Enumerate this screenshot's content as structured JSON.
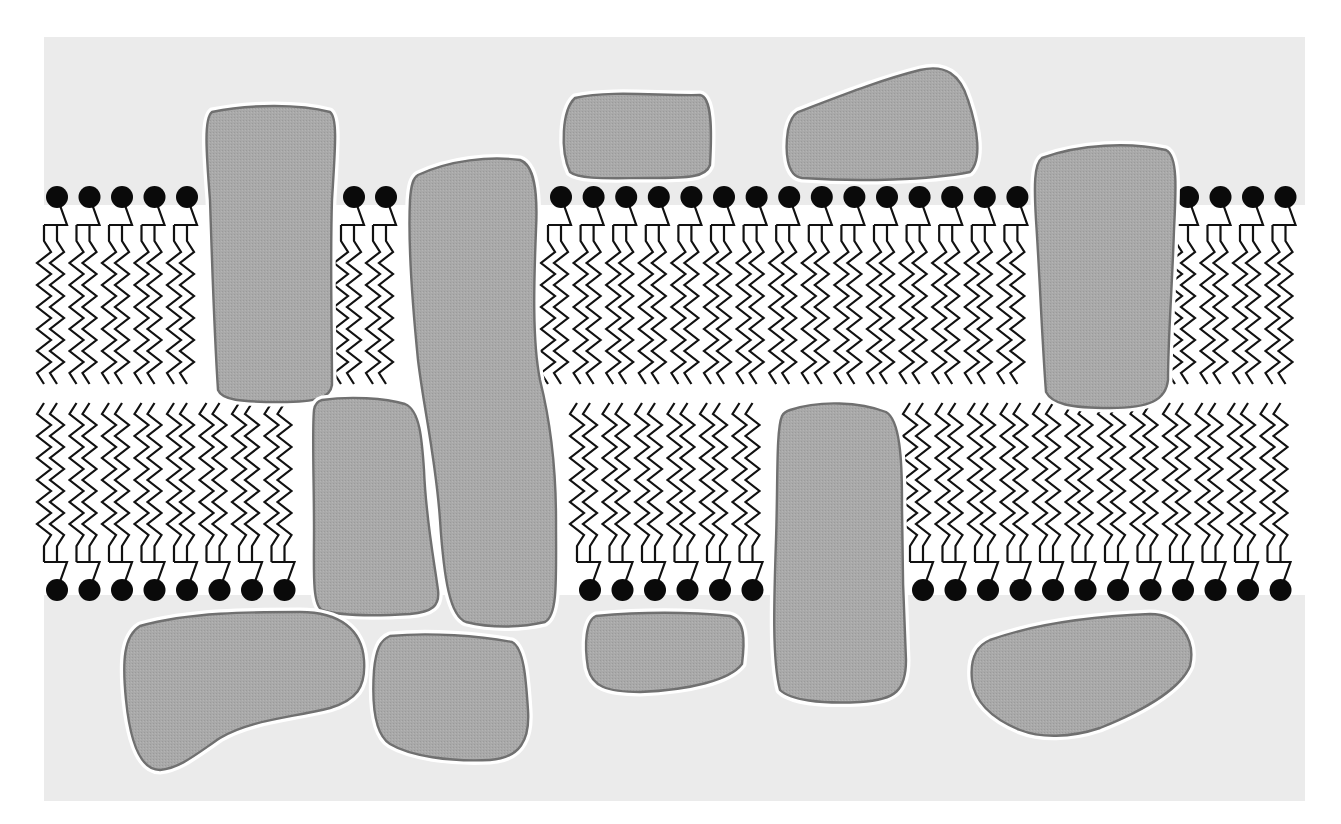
{
  "diagram": {
    "title": "Fluid mosaic model of the cell membrane",
    "canvas": {
      "width": 1341,
      "height": 824
    },
    "colors": {
      "page_background": "#ffffff",
      "aqueous_background": "#ebebeb",
      "hydrophobic_core": "#ffffff",
      "phospholipid_head": "#0a0a0a",
      "phospholipid_tail": "#111111",
      "protein_fill": "#a9a9a9",
      "protein_outline": "#707070",
      "protein_halo": "#ffffff"
    },
    "aqueous_region": {
      "x": 44,
      "y": 37,
      "width": 1261,
      "height": 764
    },
    "hydrophobic_band": {
      "y_top": 205,
      "y_bottom": 595
    },
    "upper_leaflet": {
      "head_y": 197,
      "head_radius": 11,
      "groups": [
        {
          "name": "upper-group-1",
          "x_start": 57,
          "count": 5,
          "spacing": 32.5
        },
        {
          "name": "upper-group-2",
          "x_start": 354,
          "count": 2,
          "spacing": 32
        },
        {
          "name": "upper-group-3",
          "x_start": 561,
          "count": 15,
          "spacing": 32.6
        },
        {
          "name": "upper-group-4",
          "x_start": 1188,
          "count": 4,
          "spacing": 32.5
        }
      ]
    },
    "lower_leaflet": {
      "head_y": 590,
      "head_radius": 11,
      "groups": [
        {
          "name": "lower-group-1",
          "x_start": 57,
          "count": 8,
          "spacing": 32.5
        },
        {
          "name": "lower-group-2",
          "x_start": 590,
          "count": 6,
          "spacing": 32.5
        },
        {
          "name": "lower-group-3",
          "x_start": 923,
          "count": 12,
          "spacing": 32.5
        }
      ]
    },
    "proteins": [
      {
        "name": "integral-protein-upper-left",
        "type": "integral",
        "d": "M212,112 C250,104 300,104 330,112 C338,118 335,150 332,200 C330,260 332,330 332,385 C330,398 318,402 280,402 C240,402 222,400 218,390 C214,330 212,260 210,200 C206,150 204,118 212,112 Z"
      },
      {
        "name": "peripheral-protein-top-1",
        "type": "peripheral",
        "d": "M575,98 C610,90 660,96 700,95 C712,97 712,130 710,165 C706,177 690,178 650,178 C610,178 580,180 570,172 C560,150 562,110 575,98 Z"
      },
      {
        "name": "peripheral-protein-top-2",
        "type": "peripheral",
        "d": "M798,112 C840,96 880,80 920,70 C945,64 960,74 968,100 C978,130 982,160 970,172 C930,180 860,182 802,178 C786,176 785,150 788,130 C790,120 793,115 798,112 Z"
      },
      {
        "name": "integral-protein-tall-center-left",
        "type": "integral",
        "d": "M418,175 C450,160 490,156 520,160 C534,165 538,190 536,230 C534,280 532,340 540,380 C550,420 556,470 556,520 C556,580 558,615 545,622 C520,628 490,628 466,622 C450,616 444,580 440,520 C436,460 424,410 418,360 C412,300 408,240 410,200 C411,185 413,178 418,175 Z"
      },
      {
        "name": "integral-protein-lower-left",
        "type": "integral",
        "d": "M322,400 C350,396 385,398 405,404 C420,410 422,440 424,470 C426,520 434,560 438,590 C440,606 432,612 410,614 C375,616 340,616 322,610 C312,604 314,570 314,530 C314,480 312,430 314,410 C315,404 318,401 322,400 Z"
      },
      {
        "name": "integral-protein-right-upper",
        "type": "integral",
        "d": "M1042,158 C1080,144 1130,142 1166,150 C1178,156 1176,190 1174,230 C1172,290 1168,340 1168,380 C1166,400 1150,408 1110,408 C1070,408 1052,404 1046,392 C1042,340 1040,280 1036,220 C1034,186 1034,164 1042,158 Z"
      },
      {
        "name": "integral-protein-center-lower",
        "type": "integral",
        "d": "M790,410 C820,400 860,402 886,412 C900,420 902,460 902,500 C902,560 904,620 906,660 C906,690 896,700 860,702 C820,704 790,700 780,690 C772,660 774,600 776,540 C778,480 776,430 782,416 C784,412 787,411 790,410 Z"
      },
      {
        "name": "peripheral-protein-bottom-1",
        "type": "peripheral",
        "d": "M140,626 C190,612 250,612 300,612 C340,612 362,630 364,660 C366,688 356,700 330,708 C290,718 250,720 220,738 C195,755 180,768 160,770 C140,770 130,740 126,700 C122,660 124,636 140,626 Z"
      },
      {
        "name": "peripheral-protein-bottom-2",
        "type": "peripheral",
        "d": "M390,636 C430,632 480,636 512,642 C524,648 526,680 528,710 C530,740 520,758 490,760 C450,762 410,756 390,744 C374,734 372,700 374,670 C376,650 380,640 390,636 Z"
      },
      {
        "name": "peripheral-protein-bottom-3",
        "type": "peripheral",
        "d": "M596,616 C640,612 690,612 730,616 C745,620 745,640 742,664 C730,680 690,690 640,692 C606,692 592,686 588,668 C584,644 586,620 596,616 Z"
      },
      {
        "name": "peripheral-protein-bottom-4",
        "type": "peripheral",
        "d": "M990,640 C1040,622 1100,616 1150,614 C1180,614 1196,640 1190,666 C1180,690 1140,712 1100,728 C1070,738 1040,738 1020,730 C990,718 974,700 972,680 C970,660 976,646 990,640 Z"
      }
    ],
    "legend": {
      "aqueous_label": "Extracellular / cytoplasmic aqueous environment",
      "head_label": "Hydrophilic phosphate head",
      "tail_label": "Hydrophobic fatty-acid tails",
      "protein_label": "Membrane proteins"
    }
  }
}
